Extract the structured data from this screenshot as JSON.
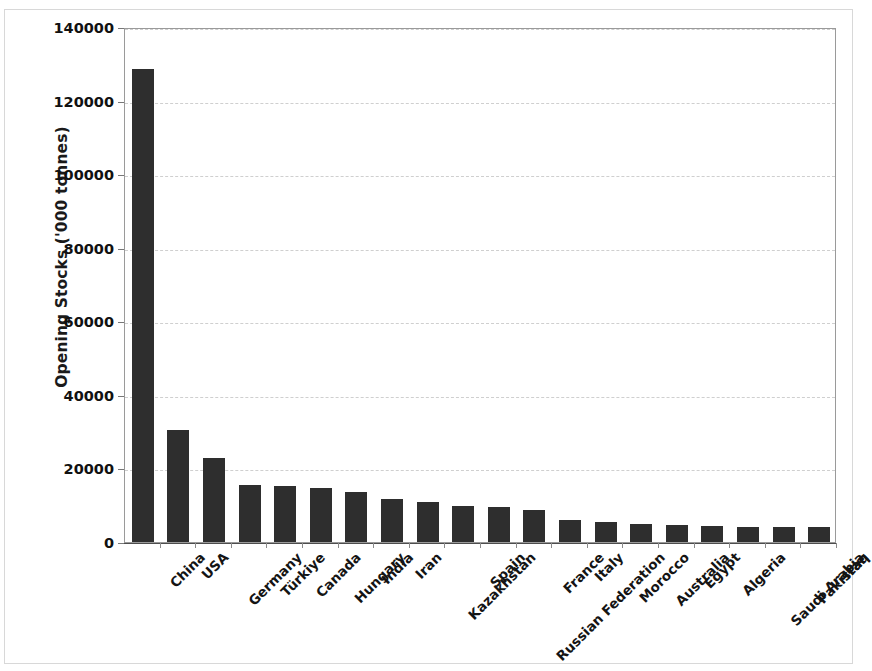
{
  "chart_data": {
    "type": "bar",
    "title": "",
    "xlabel": "",
    "ylabel": "Opening Stocks ('000 tonnes)",
    "ylim": [
      0,
      140000
    ],
    "ytick_step": 20000,
    "yticks": [
      "0",
      "20000",
      "40000",
      "60000",
      "80000",
      "100000",
      "120000",
      "140000"
    ],
    "grid": true,
    "legend": "none",
    "bar_color": "#2e2e2e",
    "categories": [
      "China",
      "USA",
      "Germany",
      "Türkiye",
      "Canada",
      "Hungary",
      "India",
      "Iran",
      "Kazakhstan",
      "Spain",
      "Russian Federation",
      "France",
      "Italy",
      "Morocco",
      "Australia",
      "Egypt",
      "Algeria",
      "Saudi Arabia",
      "Pakistan",
      "Iraq"
    ],
    "values": [
      128700,
      30500,
      22900,
      15600,
      15100,
      14600,
      13700,
      11600,
      10800,
      9800,
      9400,
      8600,
      6000,
      5500,
      5000,
      4500,
      4300,
      4200,
      4100,
      4000
    ]
  }
}
